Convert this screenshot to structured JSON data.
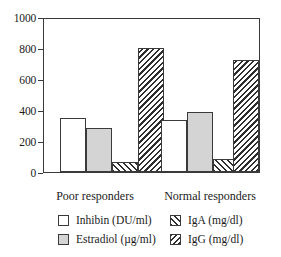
{
  "chart_data": {
    "type": "bar",
    "title": "",
    "subtitle": "",
    "xlabel": "",
    "ylabel": "",
    "ylim": [
      0,
      1000
    ],
    "yticks": [
      0,
      200,
      400,
      600,
      800,
      1000
    ],
    "ytick_labels": [
      "0",
      "200",
      "400",
      "600",
      "800",
      "1000"
    ],
    "grid": false,
    "legend_position": "bottom",
    "categories": [
      "Poor responders",
      "Normal responders"
    ],
    "series": [
      {
        "name": "Inhibin (DU/ml)",
        "legend_label": "Inhibin (DU/ml)",
        "fill": "white",
        "color": "#ffffff",
        "values": [
          350,
          340
        ]
      },
      {
        "name": "Estradiol (µg/ml)",
        "legend_label": "Estradiol (µg/ml)",
        "fill": "solid-gray",
        "color": "#d4d4d4",
        "values": [
          290,
          390
        ]
      },
      {
        "name": "IgA (mg/dl)",
        "legend_label": "IgA (mg/dl)",
        "fill": "hatch-forward",
        "color": "#2e2e2e",
        "values": [
          65,
          85
        ]
      },
      {
        "name": "IgG (mg/dl)",
        "legend_label": "IgG (mg/dl)",
        "fill": "hatch-back",
        "color": "#2e2e2e",
        "values": [
          810,
          730
        ]
      }
    ]
  },
  "axis": {
    "tick_1000": "1000",
    "tick_800": "800",
    "tick_600": "600",
    "tick_400": "400",
    "tick_200": "200",
    "tick_0": "0"
  },
  "groups": {
    "poor": "Poor responders",
    "normal": "Normal responders"
  },
  "legend": {
    "inhibin": "Inhibin (DU/ml)",
    "estradiol": "Estradiol (µg/ml)",
    "iga": "IgA (mg/dl)",
    "igg": "IgG (mg/dl)"
  }
}
